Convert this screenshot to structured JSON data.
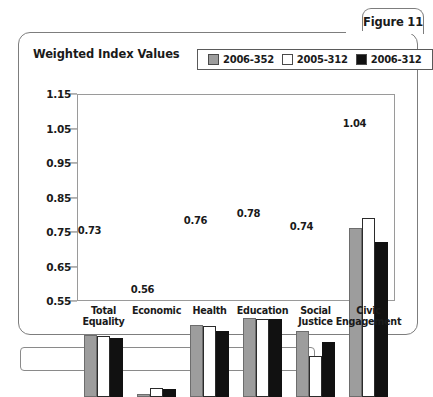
{
  "figure": {
    "tab_label": "Figure 11",
    "title": "Weighted Index Values"
  },
  "chart_data": {
    "type": "bar",
    "title": "Weighted Index Values",
    "xlabel": "",
    "ylabel": "",
    "ylim": [
      0.55,
      1.15
    ],
    "ytick_labels": [
      "1.15",
      "1.05",
      "0.95",
      "0.85",
      "0.75",
      "0.65",
      "0.55"
    ],
    "yticks": [
      1.15,
      1.05,
      0.95,
      0.85,
      0.75,
      0.65,
      0.55
    ],
    "grid": false,
    "legend_position": "top-right",
    "categories": [
      "Total\nEquality",
      "Economic",
      "Health",
      "Education",
      "Social\nJustice",
      "Civic\nEngagement"
    ],
    "series": [
      {
        "name": "2006-352",
        "color": "#9d9d9d",
        "values": [
          0.73,
          0.56,
          0.76,
          0.78,
          0.74,
          1.04
        ]
      },
      {
        "name": "2005-312",
        "color": "#ffffff",
        "values": [
          0.728,
          0.575,
          0.755,
          0.775,
          0.67,
          1.07
        ]
      },
      {
        "name": "2006-312",
        "color": "#111111",
        "values": [
          0.72,
          0.572,
          0.74,
          0.777,
          0.71,
          1.0
        ]
      }
    ],
    "data_labels": [
      {
        "category": "Total Equality",
        "series": "2006-352",
        "text": "0.73"
      },
      {
        "category": "Economic",
        "series": "2006-352",
        "text": "0.56"
      },
      {
        "category": "Health",
        "series": "2006-352",
        "text": "0.76"
      },
      {
        "category": "Education",
        "series": "2006-352",
        "text": "0.78"
      },
      {
        "category": "Social Justice",
        "series": "2006-352",
        "text": "0.74"
      },
      {
        "category": "Civic Engagement",
        "series": "2006-352",
        "text": "1.04"
      }
    ]
  }
}
